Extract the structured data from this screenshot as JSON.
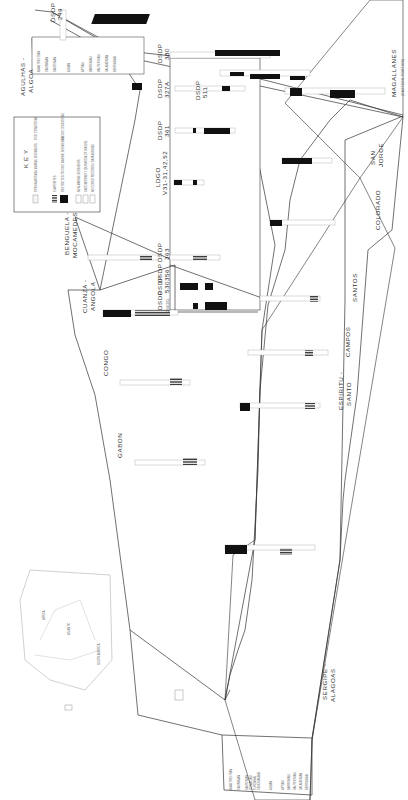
{
  "diagram": {
    "type": "stratigraphic fence diagram",
    "orientation": "rotated 90 degrees clockwise",
    "colors": {
      "line": "#333333",
      "facies_black": "#111111",
      "background": "#ffffff"
    }
  },
  "basins": {
    "african_margin": [
      {
        "id": "gabon",
        "label": "GABON"
      },
      {
        "id": "congo",
        "label": "CONGO"
      },
      {
        "id": "cuanza",
        "label": "CUANZA -\nANGOLA",
        "line1": "CUANZA -",
        "line2": "ANGOLA"
      },
      {
        "id": "benguela",
        "label": "BENGUELA -\nMOCAMEDES",
        "line1": "BENGUELA -",
        "line2": "MOCAMEDES"
      },
      {
        "id": "agulhas",
        "label": "AGULHAS -\nALGOA",
        "line1": "AGULHAS -",
        "line2": "ALGOA"
      }
    ],
    "south_american_margin": [
      {
        "id": "sergipe",
        "line1": "SERGIPE -",
        "line2": "ALAGOAS"
      },
      {
        "id": "espiritu",
        "line1": "ESPIRITU -",
        "line2": "SANTO"
      },
      {
        "id": "campos",
        "label": "CAMPOS"
      },
      {
        "id": "santos",
        "label": "SANTOS"
      },
      {
        "id": "colorado",
        "label": "COLORADO"
      },
      {
        "id": "sanjorge",
        "line1": "SAN",
        "line2": "JORGE"
      },
      {
        "id": "magallanes",
        "line1": "MAGALLANES",
        "line2": "(EASTERN PORTION)"
      }
    ]
  },
  "sites": [
    {
      "id": "dsdp249",
      "line1": "DSDP",
      "line2": "249"
    },
    {
      "id": "dsdp330",
      "line1": "DSDP",
      "line2": "330"
    },
    {
      "id": "dsdp511",
      "line1": "DSDP",
      "line2": "511"
    },
    {
      "id": "dsdp327a",
      "line1": "DSDP",
      "line2": "327A"
    },
    {
      "id": "dsdp361",
      "line1": "DSDP",
      "line2": "361"
    },
    {
      "id": "ldgo",
      "line1": "LDGO",
      "line2": "V31-31,42,52"
    },
    {
      "id": "dsdp363",
      "line1": "DSDP",
      "line2": "363"
    },
    {
      "id": "dsdp356",
      "line1": "DSDP",
      "line2": "356"
    },
    {
      "id": "dsdp530",
      "line1": "DSDP",
      "line2": "530"
    },
    {
      "id": "dsdp364",
      "line1": "DSDP",
      "line2": "364/365"
    }
  ],
  "key": {
    "title": "K E Y",
    "items": [
      {
        "label": "OPEN MARITIMAL MARINE SEDIMENTS",
        "swatch": "blank"
      },
      {
        "label": "OXIC CONDITIONS",
        "swatch": "none"
      },
      {
        "label": "EVAPORITES",
        "swatch": "hatched"
      },
      {
        "label": "RESTRICTED-TO-OXIC MARINE SEDIMENTS",
        "swatch": "black"
      },
      {
        "label": "ANOXIC CONDITIONS",
        "swatch": "none"
      },
      {
        "label": "NON-MARINE SEDIMENTS",
        "swatch": "dotted"
      },
      {
        "label": "UNCONFORMITY (DURATION OF HIATUS)",
        "swatch": "wavy"
      },
      {
        "label": "NO CORED RECORDS / DATA MISSING",
        "swatch": "empty"
      }
    ]
  },
  "stratigraphy_legend": {
    "stages": [
      {
        "age": "70",
        "name": "MAASTRICHTIAN"
      },
      {
        "age": "80",
        "name": "CAMPANIAN"
      },
      {
        "age": "90",
        "name": "SANTONIAN"
      },
      {
        "age": "",
        "name": "CONIACIAN"
      },
      {
        "age": "",
        "name": "TURONIAN"
      },
      {
        "age": "",
        "name": "CENOMANIAN"
      },
      {
        "age": "100",
        "name": "ALBIAN"
      },
      {
        "age": "110",
        "name": "APTIAN"
      },
      {
        "age": "120",
        "name": "BARREMIAN"
      },
      {
        "age": "",
        "name": "HAUTERIVIAN"
      },
      {
        "age": "130",
        "name": "VALANGINIAN"
      },
      {
        "age": "",
        "name": "BERRIASIAN"
      }
    ]
  },
  "inset_map": {
    "labels": [
      "AFRICA",
      "SOUTH AMERICA",
      "ATLANTIC",
      "BRAZIL BASIN",
      "ANGOLA BASIN",
      "ARGENTINE BASIN",
      "CAPE BASIN"
    ]
  }
}
